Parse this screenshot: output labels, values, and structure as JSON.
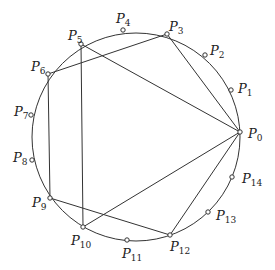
{
  "diagram": {
    "title": "",
    "circle": {
      "cx": 136,
      "cy": 137,
      "r": 104
    },
    "points": [
      {
        "name": "P",
        "sub": "0",
        "x": 240,
        "y": 132,
        "lx": 248,
        "ly": 138
      },
      {
        "name": "P",
        "sub": "1",
        "x": 231,
        "y": 90,
        "lx": 238,
        "ly": 93
      },
      {
        "name": "P",
        "sub": "2",
        "x": 205,
        "y": 55,
        "lx": 210,
        "ly": 55
      },
      {
        "name": "P",
        "sub": "3",
        "x": 167,
        "y": 34,
        "lx": 169,
        "ly": 31
      },
      {
        "name": "P",
        "sub": "4",
        "x": 123,
        "y": 30,
        "lx": 116,
        "ly": 23
      },
      {
        "name": "P",
        "sub": "5",
        "x": 81,
        "y": 44,
        "lx": 68,
        "ly": 40
      },
      {
        "name": "P",
        "sub": "6",
        "x": 48,
        "y": 74,
        "lx": 31,
        "ly": 71
      },
      {
        "name": "P",
        "sub": "7",
        "x": 31,
        "y": 115,
        "lx": 14,
        "ly": 116
      },
      {
        "name": "P",
        "sub": "8",
        "x": 32,
        "y": 160,
        "lx": 13,
        "ly": 162
      },
      {
        "name": "P",
        "sub": "9",
        "x": 50,
        "y": 198,
        "lx": 32,
        "ly": 207
      },
      {
        "name": "P",
        "sub": "10",
        "x": 83,
        "y": 227,
        "lx": 71,
        "ly": 245
      },
      {
        "name": "P",
        "sub": "11",
        "x": 127,
        "y": 240,
        "lx": 122,
        "ly": 258
      },
      {
        "name": "P",
        "sub": "12",
        "x": 170,
        "y": 235,
        "lx": 170,
        "ly": 251
      },
      {
        "name": "P",
        "sub": "13",
        "x": 208,
        "y": 212,
        "lx": 216,
        "ly": 220
      },
      {
        "name": "P",
        "sub": "14",
        "x": 232,
        "y": 177,
        "lx": 242,
        "ly": 183
      }
    ],
    "chords": [
      [
        0,
        3
      ],
      [
        0,
        5
      ],
      [
        0,
        10
      ],
      [
        0,
        12
      ],
      [
        3,
        6
      ],
      [
        5,
        10
      ],
      [
        6,
        9
      ],
      [
        9,
        12
      ]
    ]
  }
}
